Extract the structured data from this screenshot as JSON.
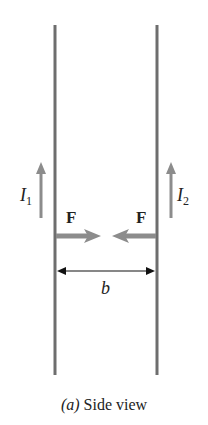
{
  "figure": {
    "caption_prefix": "(a)",
    "caption_text": " Side view",
    "labels": {
      "current_left": "I",
      "current_left_sub": "1",
      "current_right": "I",
      "current_right_sub": "2",
      "force_left": "F",
      "force_right": "F",
      "separation": "b"
    },
    "colors": {
      "wire": "#6e6e6e",
      "arrow": "#8c8c8c",
      "dimension": "#111111",
      "text": "#222222"
    }
  }
}
